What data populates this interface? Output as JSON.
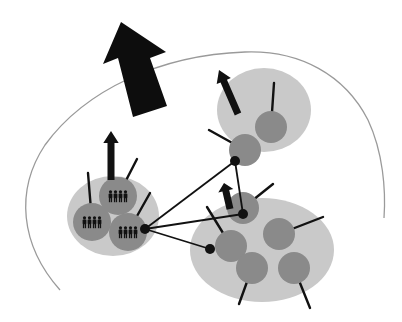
{
  "diagram": {
    "type": "network-clusters",
    "description": "Clusters of groups inside a larger boundary, connected by links, with arrows indicating outward/upward movement",
    "colors": {
      "background": "#ffffff",
      "boundary": "#9a9a9a",
      "cluster_fill": "#c9c9c9",
      "node_fill": "#8a8a8a",
      "ink": "#111111"
    },
    "boundary": {
      "shape": "open-arc"
    },
    "big_arrow": {
      "direction": "up-left",
      "from": [
        150,
        113
      ],
      "to": [
        121,
        22
      ]
    },
    "clusters": [
      {
        "id": "left",
        "center": [
          113,
          216
        ],
        "rx": 46,
        "ry": 40,
        "nodes": [
          {
            "center": [
              118,
              196
            ],
            "r": 19,
            "icon": "people-group-icon",
            "spoke_to": [
              137,
              159
            ]
          },
          {
            "center": [
              92,
              222
            ],
            "r": 19,
            "icon": "people-group-icon",
            "spoke_to": [
              88,
              173
            ]
          },
          {
            "center": [
              128,
              232
            ],
            "r": 19,
            "icon": "people-group-icon",
            "spoke_to": [
              150,
              193
            ]
          }
        ],
        "arrow": {
          "from": [
            111,
            180
          ],
          "to": [
            111,
            131
          ]
        }
      },
      {
        "id": "top-right",
        "center": [
          264,
          110
        ],
        "rx": 47,
        "ry": 42,
        "nodes": [
          {
            "center": [
              271,
              127
            ],
            "r": 16,
            "spoke_to": [
              274,
              83
            ]
          },
          {
            "center": [
              245,
              150
            ],
            "r": 16,
            "spoke_to": [
              209,
              130
            ]
          }
        ],
        "arrow": {
          "from": [
            238,
            114
          ],
          "to": [
            219,
            70
          ]
        }
      },
      {
        "id": "bottom-right",
        "center": [
          262,
          250
        ],
        "rx": 72,
        "ry": 52,
        "nodes": [
          {
            "center": [
              243,
              208
            ],
            "r": 16,
            "spoke_to": [
              273,
              184
            ]
          },
          {
            "center": [
              279,
              234
            ],
            "r": 16,
            "spoke_to": [
              323,
              217
            ]
          },
          {
            "center": [
              231,
              246
            ],
            "r": 16,
            "spoke_to": [
              207,
              207
            ]
          },
          {
            "center": [
              252,
              268
            ],
            "r": 16,
            "spoke_to": [
              239,
              304
            ]
          },
          {
            "center": [
              294,
              268
            ],
            "r": 16,
            "spoke_to": [
              310,
              308
            ]
          }
        ],
        "arrow": {
          "from": [
            230,
            209
          ],
          "to": [
            224,
            183
          ]
        }
      }
    ],
    "hubs": [
      [
        145,
        229
      ],
      [
        235,
        161
      ],
      [
        243,
        214
      ],
      [
        210,
        249
      ]
    ],
    "links": [
      [
        0,
        1
      ],
      [
        0,
        2
      ],
      [
        0,
        3
      ],
      [
        1,
        2
      ]
    ]
  }
}
